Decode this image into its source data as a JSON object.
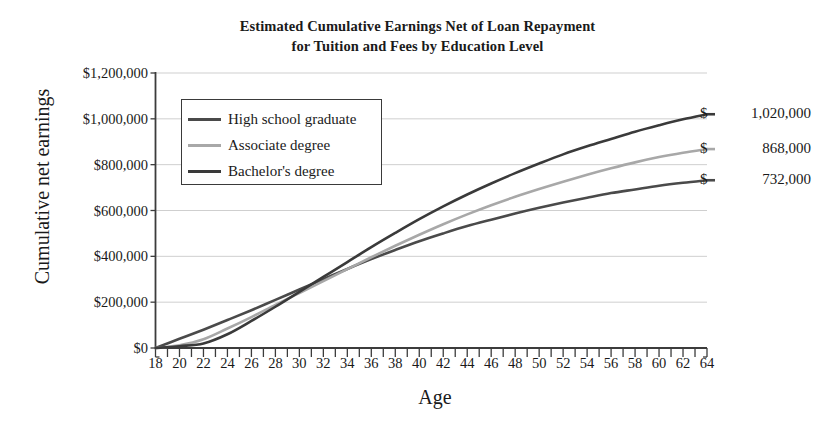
{
  "chart_data": {
    "type": "line",
    "title": "Estimated Cumulative Earnings Net of Loan Repayment for Tuition and Fees by Education Level",
    "title_line1": "Estimated Cumulative Earnings Net of Loan Repayment",
    "title_line2": "for Tuition and Fees by Education Level",
    "xlabel": "Age",
    "ylabel": "Cumulative net earnings",
    "xlim": [
      18,
      64
    ],
    "ylim": [
      0,
      1200000
    ],
    "grid": true,
    "legend_position": "upper-left-inside",
    "y_ticks": [
      0,
      200000,
      400000,
      600000,
      800000,
      1000000,
      1200000
    ],
    "y_tick_labels": [
      "$0",
      "$200,000",
      "$400,000",
      "$600,000",
      "$800,000",
      "$1,000,000",
      "$1,200,000"
    ],
    "x_ticks": [
      18,
      19,
      20,
      21,
      22,
      23,
      24,
      25,
      26,
      27,
      28,
      29,
      30,
      31,
      32,
      33,
      34,
      35,
      36,
      37,
      38,
      39,
      40,
      41,
      42,
      43,
      44,
      45,
      46,
      47,
      48,
      49,
      50,
      51,
      52,
      53,
      54,
      55,
      56,
      57,
      58,
      59,
      60,
      61,
      62,
      63,
      64
    ],
    "x_tick_labels": [
      "18",
      "20",
      "22",
      "24",
      "26",
      "28",
      "30",
      "32",
      "34",
      "36",
      "38",
      "40",
      "42",
      "44",
      "46",
      "48",
      "50",
      "52",
      "54",
      "56",
      "58",
      "60",
      "62",
      "64"
    ],
    "x": [
      18,
      20,
      22,
      24,
      26,
      28,
      30,
      32,
      34,
      36,
      38,
      40,
      42,
      44,
      46,
      48,
      50,
      52,
      54,
      56,
      58,
      60,
      62,
      64
    ],
    "series": [
      {
        "name": "High school graduate",
        "color": "#4a4a4a",
        "end_value": 732000,
        "end_label": "$  732,000",
        "values": [
          0,
          40000,
          80000,
          122000,
          165000,
          210000,
          255000,
          300000,
          345000,
          388000,
          428000,
          466000,
          500000,
          532000,
          560000,
          587000,
          612000,
          635000,
          656000,
          676000,
          692000,
          708000,
          721000,
          732000
        ]
      },
      {
        "name": "Associate degree",
        "color": "#a8a8a8",
        "end_value": 868000,
        "end_label": "$  868,000",
        "values": [
          0,
          12000,
          38000,
          85000,
          135000,
          188000,
          240000,
          292000,
          344000,
          396000,
          446000,
          494000,
          540000,
          583000,
          623000,
          660000,
          694000,
          726000,
          756000,
          784000,
          810000,
          833000,
          852000,
          868000
        ]
      },
      {
        "name": "Bachelor's degree",
        "color": "#3a3a3a",
        "end_value": 1020000,
        "end_label": "$ 1,020,000",
        "values": [
          0,
          8000,
          20000,
          60000,
          118000,
          180000,
          245000,
          310000,
          375000,
          440000,
          502000,
          562000,
          618000,
          670000,
          718000,
          763000,
          805000,
          845000,
          880000,
          912000,
          944000,
          972000,
          998000,
          1020000
        ]
      }
    ],
    "end_value_labels": [
      {
        "currency": "$",
        "amount": "1,020,000",
        "series": "Bachelor's degree"
      },
      {
        "currency": "$",
        "amount": "868,000",
        "series": "Associate degree"
      },
      {
        "currency": "$",
        "amount": "732,000",
        "series": "High school graduate"
      }
    ]
  }
}
